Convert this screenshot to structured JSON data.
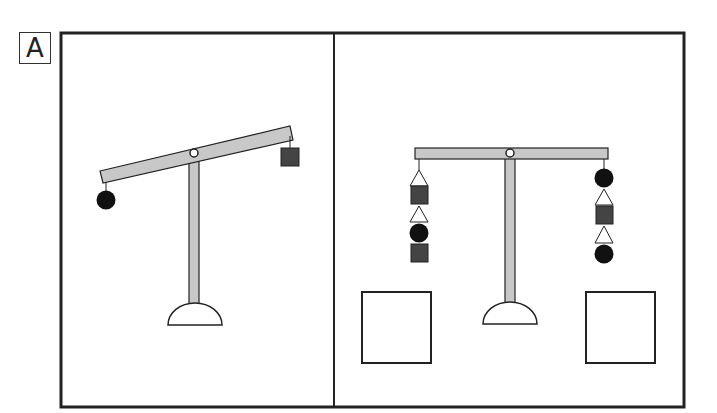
{
  "figure": {
    "panel_label": "A",
    "colors": {
      "beam": "#c8c8c8",
      "stroke": "#222222",
      "square_weight": "#444444",
      "circle_weight": "#111111",
      "background": "#ffffff"
    },
    "left_panel": {
      "description": "Tilted balance scale: left arm down with one circle, right arm up with one square",
      "left_arm": [
        "circle"
      ],
      "right_arm": [
        "square"
      ]
    },
    "right_panel": {
      "description": "Level balance scale with stacked weights on each side and two empty answer boxes",
      "left_arm": [
        "triangle",
        "square",
        "triangle",
        "circle",
        "square"
      ],
      "right_arm": [
        "circle",
        "triangle",
        "square",
        "triangle",
        "circle"
      ],
      "answer_boxes": [
        "left-empty",
        "right-empty"
      ]
    }
  }
}
